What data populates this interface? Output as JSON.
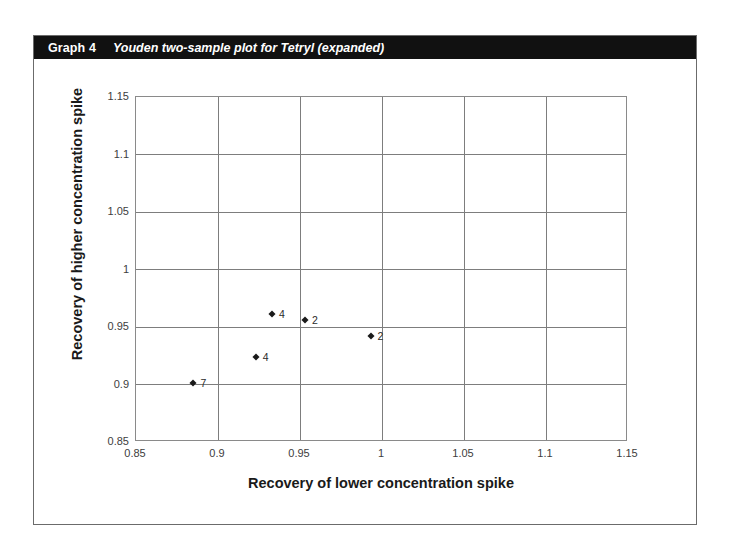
{
  "caption": {
    "number": "Graph 4",
    "title": "Youden two-sample plot for Tetryl (expanded)"
  },
  "colors": {
    "caption_bar_bg": "#111111",
    "caption_text": "#ffffff",
    "frame_border": "#6b6b6b",
    "grid": "#7d7d7d",
    "marker": "#1a1a1a",
    "tick_text": "#3d3d3d"
  },
  "chart_data": {
    "type": "scatter",
    "title": "Youden two-sample plot for Tetryl (expanded)",
    "xlabel": "Recovery of lower concentration spike",
    "ylabel": "Recovery of higher concentration spike",
    "xlim": [
      0.85,
      1.15
    ],
    "ylim": [
      0.85,
      1.15
    ],
    "xticks": [
      "0.85",
      "0.9",
      "0.95",
      "1",
      "1.05",
      "1.1",
      "1.15"
    ],
    "yticks": [
      "0.85",
      "0.9",
      "0.95",
      "1",
      "1.05",
      "1.1",
      "1.15"
    ],
    "xtick_values": [
      0.85,
      0.9,
      0.95,
      1.0,
      1.05,
      1.1,
      1.15
    ],
    "ytick_values": [
      0.85,
      0.9,
      0.95,
      1.0,
      1.05,
      1.1,
      1.15
    ],
    "grid": true,
    "legend": false,
    "points": [
      {
        "label": "4",
        "x": 0.933,
        "y": 0.961
      },
      {
        "label": "2",
        "x": 0.953,
        "y": 0.956
      },
      {
        "label": "2",
        "x": 0.993,
        "y": 0.942
      },
      {
        "label": "4",
        "x": 0.923,
        "y": 0.924
      },
      {
        "label": "7",
        "x": 0.885,
        "y": 0.901
      }
    ]
  }
}
